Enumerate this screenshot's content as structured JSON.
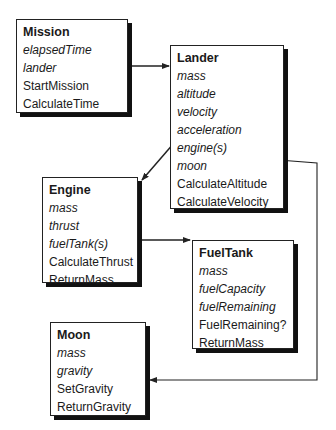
{
  "diagram": {
    "type": "class-diagram",
    "classes": {
      "mission": {
        "name": "Mission",
        "attributes": [
          "elapsedTime",
          "lander"
        ],
        "operations": [
          "StartMission",
          "CalculateTime"
        ]
      },
      "lander": {
        "name": "Lander",
        "attributes": [
          "mass",
          "altitude",
          "velocity",
          "acceleration",
          "engine(s)",
          "moon"
        ],
        "operations": [
          "CalculateAltitude",
          "CalculateVelocity"
        ]
      },
      "engine": {
        "name": "Engine",
        "attributes": [
          "mass",
          "thrust",
          "fuelTank(s)"
        ],
        "operations": [
          "CalculateThrust",
          "ReturnMass"
        ]
      },
      "fueltank": {
        "name": "FuelTank",
        "attributes": [
          "mass",
          "fuelCapacity",
          "fuelRemaining"
        ],
        "operations": [
          "FuelRemaining?",
          "ReturnMass"
        ]
      },
      "moon": {
        "name": "Moon",
        "attributes": [
          "mass",
          "gravity"
        ],
        "operations": [
          "SetGravity",
          "ReturnGravity"
        ]
      }
    },
    "associations": [
      {
        "from": "Mission.lander",
        "to": "Lander"
      },
      {
        "from": "Lander.engine(s)",
        "to": "Engine"
      },
      {
        "from": "Engine.fuelTank(s)",
        "to": "FuelTank"
      },
      {
        "from": "Lander.moon",
        "to": "Moon"
      }
    ],
    "colors": {
      "line": "#222222",
      "shadow": "#111111",
      "background": "#ffffff"
    }
  }
}
